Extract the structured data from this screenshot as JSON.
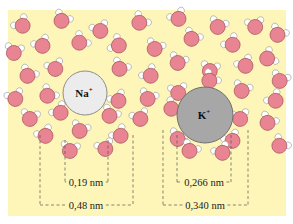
{
  "background": {
    "color": "#fdf6b8",
    "x": 8,
    "y": 10,
    "w": 278,
    "h": 206
  },
  "colors": {
    "oxygen": "#e98493",
    "oxygen_stroke": "#9a4a55",
    "hydrogen": "#ffffff",
    "hydrogen_stroke": "#8a8a8a",
    "na_fill": "#ececec",
    "na_stroke": "#8c8c8c",
    "k_fill": "#a7a7a7",
    "k_stroke": "#6f6f6f",
    "dash": "#555555"
  },
  "ions": [
    {
      "name": "na-ion",
      "symbol": "Na",
      "charge": "+",
      "cx": 85,
      "cy": 93,
      "r": 22
    },
    {
      "name": "k-ion",
      "symbol": "K",
      "charge": "+",
      "cx": 205,
      "cy": 115,
      "r": 28
    }
  ],
  "measurements": [
    {
      "name": "na-inner-distance",
      "label": "0,19 nm",
      "x1": 65,
      "x2": 108,
      "top": 140,
      "y": 182,
      "label_x": 86
    },
    {
      "name": "na-outer-distance",
      "label": "0,48 nm",
      "x1": 40,
      "x2": 133,
      "top": 135,
      "y": 205,
      "label_x": 86
    },
    {
      "name": "k-inner-distance",
      "label": "0,266 nm",
      "x1": 177,
      "x2": 231,
      "top": 135,
      "y": 182,
      "label_x": 204
    },
    {
      "name": "k-outer-distance",
      "label": "0,340 nm",
      "x1": 163,
      "x2": 248,
      "top": 130,
      "y": 205,
      "label_x": 205
    }
  ],
  "water_molecules": [
    [
      22,
      25,
      -40
    ],
    [
      62,
      20,
      30
    ],
    [
      100,
      30,
      -20
    ],
    [
      140,
      22,
      40
    ],
    [
      178,
      18,
      -30
    ],
    [
      218,
      26,
      20
    ],
    [
      255,
      26,
      -10
    ],
    [
      278,
      34,
      30
    ],
    [
      14,
      52,
      10
    ],
    [
      42,
      45,
      -30
    ],
    [
      80,
      42,
      45
    ],
    [
      118,
      45,
      -60
    ],
    [
      155,
      48,
      20
    ],
    [
      192,
      38,
      30
    ],
    [
      232,
      44,
      -40
    ],
    [
      268,
      58,
      60
    ],
    [
      28,
      75,
      30
    ],
    [
      55,
      68,
      -20
    ],
    [
      120,
      68,
      30
    ],
    [
      150,
      75,
      -40
    ],
    [
      178,
      62,
      20
    ],
    [
      210,
      70,
      10
    ],
    [
      245,
      65,
      -30
    ],
    [
      280,
      80,
      20
    ],
    [
      15,
      98,
      -20
    ],
    [
      48,
      95,
      40
    ],
    [
      118,
      100,
      -30
    ],
    [
      148,
      98,
      20
    ],
    [
      178,
      92,
      -10
    ],
    [
      210,
      80,
      40
    ],
    [
      242,
      90,
      20
    ],
    [
      275,
      100,
      -40
    ],
    [
      30,
      118,
      10
    ],
    [
      60,
      112,
      -40
    ],
    [
      110,
      115,
      30
    ],
    [
      140,
      118,
      -20
    ],
    [
      172,
      108,
      40
    ],
    [
      240,
      118,
      -10
    ],
    [
      268,
      122,
      30
    ],
    [
      45,
      135,
      -30
    ],
    [
      80,
      130,
      20
    ],
    [
      120,
      135,
      -40
    ],
    [
      178,
      138,
      20
    ],
    [
      232,
      140,
      -30
    ],
    [
      280,
      145,
      40
    ],
    [
      70,
      150,
      10
    ],
    [
      105,
      148,
      -20
    ],
    [
      190,
      150,
      30
    ],
    [
      222,
      152,
      -30
    ]
  ]
}
